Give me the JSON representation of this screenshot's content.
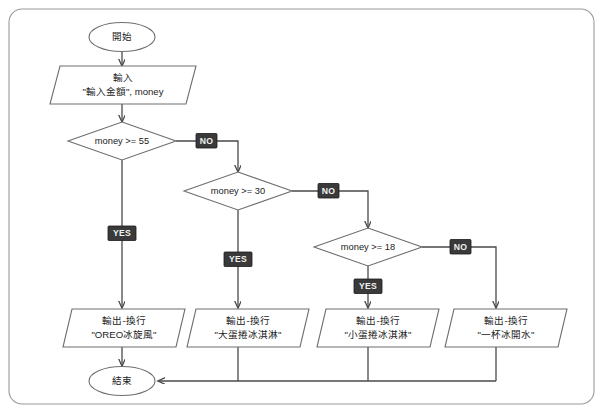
{
  "diagram": {
    "colors": {
      "background": "#ffffff",
      "shape_stroke": "#6e6e6e",
      "frame_stroke": "#9a9a9a",
      "connector": "#4a4a4a",
      "badge_fill": "#3a3a3a",
      "badge_text": "#f2f2f2",
      "text": "#1b1b1b"
    },
    "start": {
      "label": "開始"
    },
    "input": {
      "line1": "輸入",
      "line2": "\"輸入金額\", money"
    },
    "decisions": [
      {
        "condition": "money >= 55",
        "yes_label": "YES",
        "no_label": "NO"
      },
      {
        "condition": "money >= 30",
        "yes_label": "YES",
        "no_label": "NO"
      },
      {
        "condition": "money >= 18",
        "yes_label": "YES",
        "no_label": "NO"
      }
    ],
    "outputs": [
      {
        "line1": "輸出-換行",
        "line2": "\"OREO冰旋風\""
      },
      {
        "line1": "輸出-換行",
        "line2": "\"大蛋捲冰淇淋\""
      },
      {
        "line1": "輸出-換行",
        "line2": "\"小蛋捲冰淇淋\""
      },
      {
        "line1": "輸出-換行",
        "line2": "\"一杯冰開水\""
      }
    ],
    "end": {
      "label": "結束"
    }
  }
}
